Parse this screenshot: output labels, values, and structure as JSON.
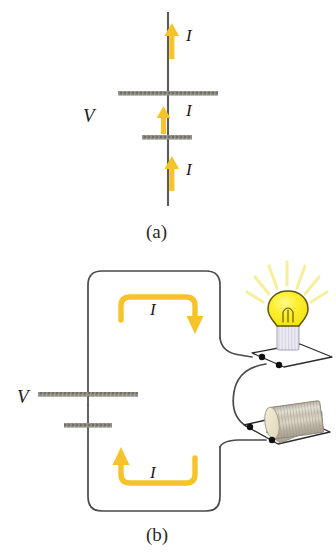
{
  "figure": {
    "type": "physics-circuit-diagram",
    "panels": [
      {
        "id": "a",
        "caption": "(a)",
        "description": "Battery symbol on a vertical wire with three current arrows pointing up",
        "labels": {
          "voltage": "V",
          "current_top": "I",
          "current_middle": "I",
          "current_bottom": "I"
        }
      },
      {
        "id": "b",
        "caption": "(b)",
        "description": "Closed circuit: battery connected through wires to a glowing light bulb and a metal cylinder resistor, with current loop arrows",
        "labels": {
          "voltage": "V",
          "current_top": "I",
          "current_bottom": "I"
        },
        "components": [
          {
            "name": "battery",
            "label": "V"
          },
          {
            "name": "light-bulb",
            "label": ""
          },
          {
            "name": "resistor-cylinder",
            "label": ""
          }
        ]
      }
    ],
    "colors": {
      "wire": "#4a4a48",
      "plate": "#7e7e76",
      "current_arrow": "#f6c42a",
      "bulb_glass": "#fbee2a",
      "bulb_outline": "#6a5b10",
      "bulb_base": "#e3e1ec",
      "ray": "#f7f0a8",
      "cylinder_body": "#c9c2b4",
      "cylinder_face": "#efe8cf",
      "terminal_dot": "#111111",
      "text": "#1b1b1b"
    }
  }
}
